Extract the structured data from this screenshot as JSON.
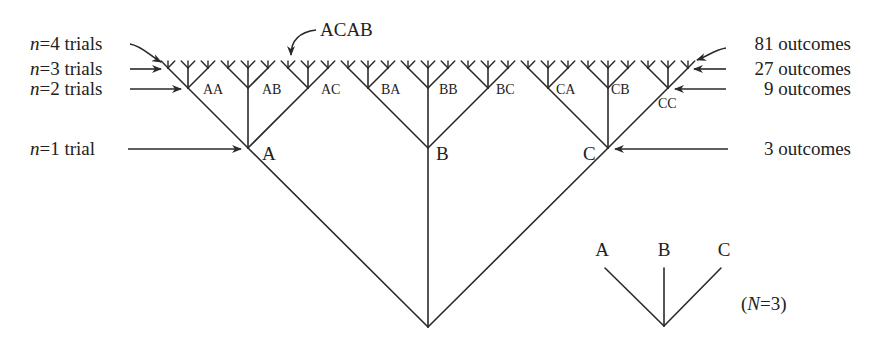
{
  "diagram": {
    "type": "tree",
    "branching_factor": 3,
    "depth": 4,
    "level_one_labels": [
      "A",
      "B",
      "C"
    ],
    "level_two_labels": [
      "AA",
      "AB",
      "AC",
      "BA",
      "BB",
      "BC",
      "CA",
      "CB",
      "CC"
    ],
    "example_leaf": "ACAB",
    "color": "#2a2a2a"
  },
  "left_annotations": [
    {
      "prefix": "n",
      "text": "=4 trials"
    },
    {
      "prefix": "n",
      "text": "=3 trials"
    },
    {
      "prefix": "n",
      "text": "=2 trials"
    },
    {
      "prefix": "n",
      "text": "=1 trial"
    }
  ],
  "right_annotations": [
    "81 outcomes",
    "27 outcomes",
    "9 outcomes",
    "3 outcomes"
  ],
  "legend": {
    "labels": [
      "A",
      "B",
      "C"
    ],
    "caption_open": "(",
    "caption_var": "N",
    "caption_rest": "=3)"
  }
}
